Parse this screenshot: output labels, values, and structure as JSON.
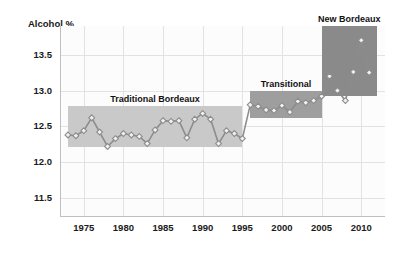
{
  "chart_data": {
    "type": "line",
    "title": "",
    "xlabel": "",
    "ylabel": "Alcohol %",
    "xlim": [
      1972,
      2013
    ],
    "ylim": [
      11.25,
      13.9
    ],
    "grid": true,
    "legend": "none",
    "x_ticks": [
      "1975",
      "1980",
      "1985",
      "1990",
      "1995",
      "2000",
      "2005",
      "2010"
    ],
    "x_tick_values": [
      1975,
      1980,
      1985,
      1990,
      1995,
      2000,
      2005,
      2010
    ],
    "y_ticks": [
      "13.5",
      "13.0",
      "12.5",
      "12.0",
      "11.5"
    ],
    "y_tick_values": [
      13.5,
      13.0,
      12.5,
      12.0,
      11.5
    ],
    "series": [
      {
        "name": "Alcohol %",
        "marker": "diamond",
        "color": "#8c8c8c",
        "x": [
          1973,
          1974,
          1975,
          1976,
          1977,
          1978,
          1979,
          1980,
          1981,
          1982,
          1983,
          1984,
          1985,
          1986,
          1987,
          1988,
          1989,
          1990,
          1991,
          1992,
          1993,
          1994,
          1995,
          1996,
          1997,
          1998,
          1999,
          2000,
          2001,
          2002,
          2003,
          2004,
          2005,
          2006,
          2007,
          2008,
          2009,
          2010,
          2011
        ],
        "values": [
          12.38,
          12.37,
          12.44,
          12.62,
          12.42,
          12.22,
          12.33,
          12.4,
          12.38,
          12.36,
          12.26,
          12.45,
          12.58,
          12.57,
          12.58,
          12.34,
          12.6,
          12.68,
          12.6,
          12.26,
          12.44,
          12.4,
          12.33,
          12.8,
          12.78,
          12.73,
          12.72,
          12.79,
          12.7,
          12.85,
          12.83,
          12.86,
          12.92,
          13.2,
          13.0,
          12.86,
          13.26,
          13.7,
          13.25
        ]
      }
    ],
    "annotations": [
      {
        "label": "Traditional Bordeaux",
        "x_start": 1973,
        "x_end": 1995,
        "y_low": 12.21,
        "y_high": 12.78,
        "shade": "#c9c9c9"
      },
      {
        "label": "Transitional",
        "x_start": 1996,
        "x_end": 2005,
        "y_low": 12.62,
        "y_high": 13.0,
        "shade": "#9e9e9e"
      },
      {
        "label": "New Bordeaux",
        "x_start": 2005,
        "x_end": 2012,
        "y_low": 12.93,
        "y_high": 13.9,
        "shade": "#8a8a8a"
      }
    ]
  }
}
